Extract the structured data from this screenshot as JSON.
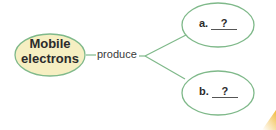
{
  "diagram": {
    "central_node": {
      "label_line1": "Mobile",
      "label_line2": "electrons",
      "fill": "#f6efc2",
      "stroke": "#7fb98a"
    },
    "connector_label": "produce",
    "branches": [
      {
        "prefix": "a.",
        "answer": "?"
      },
      {
        "prefix": "b.",
        "answer": "?"
      }
    ],
    "line_color": "#7fb98a",
    "node_fill": "#ffffff"
  }
}
